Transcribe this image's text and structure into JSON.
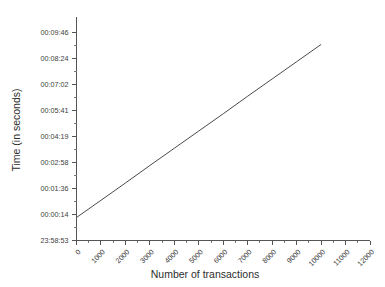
{
  "chart_data": {
    "type": "line",
    "title": "",
    "xlabel": "Number of transactions",
    "ylabel": "Time (in seconds)",
    "grid": false,
    "legend": null,
    "background_color": "#ffffff",
    "line_color": "#4a4a4a",
    "axis_color": "#555555",
    "xlim": [
      0,
      12000
    ],
    "ylim_labels": [
      "23:58:53",
      "00:09:46"
    ],
    "x_ticks": [
      0,
      1000,
      2000,
      3000,
      4000,
      5000,
      6000,
      7000,
      8000,
      9000,
      10000,
      11000,
      12000
    ],
    "x_tick_labels": [
      "0",
      "1000",
      "2000",
      "3000",
      "4000",
      "5000",
      "6000",
      "7000",
      "8000",
      "9000",
      "10000",
      "11000",
      "12000"
    ],
    "x_tick_label_rotation_deg": -45,
    "x_minor_ticks_per_interval": 1,
    "y_tick_labels": [
      "00:09:46",
      "00:08:24",
      "00:07:02",
      "00:05:41",
      "00:04:19",
      "00:02:58",
      "00:01:36",
      "00:00:14",
      "23:58:53"
    ],
    "y_tick_values_seconds": [
      586,
      504,
      422,
      341,
      259,
      178,
      96,
      14,
      -67
    ],
    "y_minor_ticks_per_interval": 1,
    "series": [
      {
        "name": "elapsed time",
        "x": [
          0,
          1000,
          2000,
          3000,
          4000,
          5000,
          6000,
          7000,
          8000,
          9000,
          10000
        ],
        "y_labels": [
          "00:00:05",
          "00:00:59",
          "00:01:53",
          "00:02:48",
          "00:03:42",
          "00:04:36",
          "00:05:30",
          "00:06:25",
          "00:07:19",
          "00:08:13",
          "00:09:07"
        ],
        "y_seconds": [
          5,
          59,
          113,
          168,
          222,
          276,
          330,
          385,
          439,
          493,
          547
        ]
      }
    ]
  }
}
